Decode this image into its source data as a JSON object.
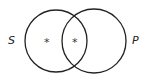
{
  "diagram": {
    "type": "venn",
    "sets": [
      {
        "id": "S",
        "label": "S"
      },
      {
        "id": "P",
        "label": "P"
      }
    ],
    "regions": [
      {
        "region": "S-only",
        "marker": "*"
      },
      {
        "region": "S∩P",
        "marker": "*"
      },
      {
        "region": "P-only",
        "marker": ""
      }
    ],
    "stroke_color": "#222222"
  }
}
